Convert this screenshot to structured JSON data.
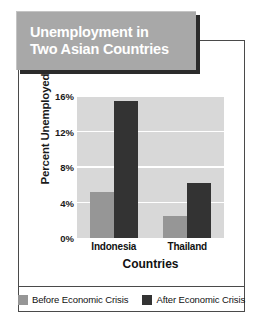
{
  "title": {
    "line1": "Unemployment in",
    "line2": "Two Asian Countries",
    "box_color": "#a8a8a8",
    "text_color": "#ffffff"
  },
  "chart_data": {
    "type": "bar",
    "title": "Unemployment in Two Asian Countries",
    "xlabel": "Countries",
    "ylabel": "Percent Unemployed",
    "categories": [
      "Indonesia",
      "Thailand"
    ],
    "series": [
      {
        "name": "Before Economic Crisis",
        "color": "#969696",
        "values": [
          5.2,
          2.5
        ]
      },
      {
        "name": "After Economic Crisis",
        "color": "#333333",
        "values": [
          15.4,
          6.2
        ]
      }
    ],
    "ylim": [
      0,
      16
    ],
    "yticks": [
      0,
      4,
      8,
      12,
      16
    ],
    "ytick_labels": [
      "0%",
      "4%",
      "8%",
      "12%",
      "16%"
    ],
    "grid": true,
    "legend_position": "bottom",
    "plot_background": "#d8d8d8",
    "gridline_color": "#ffffff"
  }
}
